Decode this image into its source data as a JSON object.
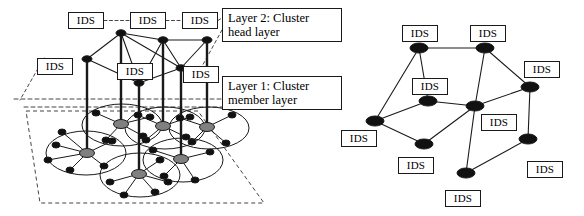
{
  "figure": {
    "ids_label": "IDS",
    "colors": {
      "stroke": "#1a1a1a",
      "node_fill": "#111111",
      "cluster_head_fill": "#808080",
      "background": "#ffffff",
      "dashed": "#444444"
    }
  },
  "left_diagram": {
    "name": "two-layer-cluster-architecture",
    "layer_labels": [
      {
        "id": "layer2",
        "text": "Layer 2: Cluster\nhead layer",
        "x": 222,
        "y": 8,
        "w": 120,
        "h": 34
      },
      {
        "id": "layer1",
        "text": "Layer 1: Cluster\nmember layer",
        "x": 222,
        "y": 76,
        "w": 120,
        "h": 34
      }
    ],
    "ids_boxes": [
      {
        "id": "left-ids-top-1",
        "x": 68,
        "y": 12,
        "w": 36,
        "h": 17
      },
      {
        "id": "left-ids-top-2",
        "x": 130,
        "y": 12,
        "w": 36,
        "h": 17
      },
      {
        "id": "left-ids-top-3",
        "x": 182,
        "y": 12,
        "w": 36,
        "h": 17
      },
      {
        "id": "left-ids-west",
        "x": 37,
        "y": 58,
        "w": 36,
        "h": 17
      },
      {
        "id": "left-ids-mid",
        "x": 117,
        "y": 63,
        "w": 36,
        "h": 17
      },
      {
        "id": "left-ids-east",
        "x": 183,
        "y": 66,
        "w": 36,
        "h": 17
      }
    ],
    "cluster_head_nodes": [
      {
        "id": "ch-a",
        "x": 121,
        "y": 33
      },
      {
        "id": "ch-b",
        "x": 163,
        "y": 40
      },
      {
        "id": "ch-c",
        "x": 207,
        "y": 40
      },
      {
        "id": "ch-d",
        "x": 87,
        "y": 59
      },
      {
        "id": "ch-e",
        "x": 181,
        "y": 68
      },
      {
        "id": "ch-f",
        "x": 139,
        "y": 83
      }
    ],
    "cluster_head_edges": [
      [
        "ch-a",
        "ch-b"
      ],
      [
        "ch-b",
        "ch-c"
      ],
      [
        "ch-a",
        "ch-d"
      ],
      [
        "ch-a",
        "ch-f"
      ],
      [
        "ch-d",
        "ch-f"
      ],
      [
        "ch-b",
        "ch-f"
      ],
      [
        "ch-b",
        "ch-e"
      ],
      [
        "ch-c",
        "ch-e"
      ],
      [
        "ch-e",
        "ch-f"
      ],
      [
        "ch-a",
        "ch-e"
      ]
    ],
    "dashed_top_ids_links": [
      [
        "left-ids-top-1",
        "left-ids-top-2"
      ],
      [
        "left-ids-top-2",
        "left-ids-top-3"
      ],
      [
        "left-ids-top-3",
        "layer2"
      ]
    ],
    "vertical_drop_lines": [
      {
        "from": "ch-a",
        "to": "cm-head-2"
      },
      {
        "from": "ch-b",
        "to": "cm-head-4"
      },
      {
        "from": "ch-c",
        "to": "cm-head-6"
      },
      {
        "from": "ch-d",
        "to": "cm-head-1"
      },
      {
        "from": "ch-e",
        "to": "cm-head-5"
      },
      {
        "from": "ch-f",
        "to": "cm-head-3"
      }
    ],
    "clusters": [
      {
        "id": "cluster-1",
        "cx": 86,
        "cy": 153,
        "rx": 40,
        "ry": 22,
        "head": {
          "id": "cm-head-1",
          "x": 87,
          "y": 153
        },
        "members": [
          {
            "x": 56,
            "y": 145
          },
          {
            "x": 48,
            "y": 160
          },
          {
            "x": 70,
            "y": 170
          },
          {
            "x": 104,
            "y": 166
          },
          {
            "x": 112,
            "y": 141
          },
          {
            "x": 62,
            "y": 132
          }
        ]
      },
      {
        "id": "cluster-2",
        "cx": 122,
        "cy": 125,
        "rx": 40,
        "ry": 21,
        "head": {
          "id": "cm-head-2",
          "x": 121,
          "y": 124
        },
        "members": [
          {
            "x": 96,
            "y": 113
          },
          {
            "x": 106,
            "y": 140
          },
          {
            "x": 143,
            "y": 136
          },
          {
            "x": 150,
            "y": 117
          }
        ]
      },
      {
        "id": "cluster-3",
        "cx": 140,
        "cy": 175,
        "rx": 40,
        "ry": 22,
        "head": {
          "id": "cm-head-3",
          "x": 139,
          "y": 174
        },
        "members": [
          {
            "x": 110,
            "y": 182
          },
          {
            "x": 124,
            "y": 195
          },
          {
            "x": 155,
            "y": 192
          },
          {
            "x": 168,
            "y": 182
          },
          {
            "x": 160,
            "y": 160
          }
        ]
      },
      {
        "id": "cluster-4",
        "cx": 165,
        "cy": 128,
        "rx": 40,
        "ry": 21,
        "head": {
          "id": "cm-head-4",
          "x": 163,
          "y": 126
        },
        "members": [
          {
            "x": 138,
            "y": 115
          },
          {
            "x": 146,
            "y": 140
          },
          {
            "x": 186,
            "y": 137
          },
          {
            "x": 190,
            "y": 117
          }
        ]
      },
      {
        "id": "cluster-5",
        "cx": 183,
        "cy": 160,
        "rx": 40,
        "ry": 22,
        "head": {
          "id": "cm-head-5",
          "x": 181,
          "y": 159
        },
        "members": [
          {
            "x": 153,
            "y": 150
          },
          {
            "x": 164,
            "y": 176
          },
          {
            "x": 195,
            "y": 180
          },
          {
            "x": 210,
            "y": 152
          }
        ]
      },
      {
        "id": "cluster-6",
        "cx": 209,
        "cy": 128,
        "rx": 40,
        "ry": 21,
        "head": {
          "id": "cm-head-6",
          "x": 207,
          "y": 127
        },
        "members": [
          {
            "x": 180,
            "y": 118
          },
          {
            "x": 192,
            "y": 142
          },
          {
            "x": 226,
            "y": 143
          },
          {
            "x": 232,
            "y": 115
          }
        ]
      }
    ],
    "ground_plane": [
      [
        26,
        111
      ],
      [
        198,
        111
      ],
      [
        264,
        203
      ],
      [
        40,
        203
      ]
    ],
    "layer_divider_lines": [
      {
        "y": 99,
        "x1": 14,
        "x2": 260
      },
      {
        "y": 107,
        "x1": 24,
        "x2": 268
      }
    ],
    "dashed_pointers": [
      {
        "from": [
          44,
          58
        ],
        "to": [
          20,
          100
        ]
      },
      {
        "from": [
          222,
          30
        ],
        "to": [
          200,
          70
        ]
      },
      {
        "from": [
          226,
          92
        ],
        "to": [
          250,
          110
        ]
      }
    ]
  },
  "right_diagram": {
    "name": "flat-peer-ids-network",
    "nodes": [
      {
        "id": "r1",
        "x": 419,
        "y": 48
      },
      {
        "id": "r2",
        "x": 485,
        "y": 48
      },
      {
        "id": "r3",
        "x": 428,
        "y": 101
      },
      {
        "id": "r4",
        "x": 475,
        "y": 106
      },
      {
        "id": "r5",
        "x": 530,
        "y": 87
      },
      {
        "id": "r6",
        "x": 375,
        "y": 121
      },
      {
        "id": "r7",
        "x": 424,
        "y": 144
      },
      {
        "id": "r8",
        "x": 528,
        "y": 139
      },
      {
        "id": "r9",
        "x": 466,
        "y": 173
      }
    ],
    "edges": [
      [
        "r1",
        "r2"
      ],
      [
        "r1",
        "r3"
      ],
      [
        "r1",
        "r6"
      ],
      [
        "r2",
        "r4"
      ],
      [
        "r2",
        "r5"
      ],
      [
        "r3",
        "r4"
      ],
      [
        "r3",
        "r6"
      ],
      [
        "r4",
        "r5"
      ],
      [
        "r4",
        "r7"
      ],
      [
        "r4",
        "r9"
      ],
      [
        "r5",
        "r8"
      ],
      [
        "r6",
        "r7"
      ],
      [
        "r8",
        "r9"
      ]
    ],
    "ids_boxes": [
      {
        "id": "right-ids-1",
        "x": 402,
        "y": 25,
        "w": 36,
        "h": 17
      },
      {
        "id": "right-ids-2",
        "x": 470,
        "y": 25,
        "w": 36,
        "h": 17
      },
      {
        "id": "right-ids-3",
        "x": 412,
        "y": 78,
        "w": 36,
        "h": 17
      },
      {
        "id": "right-ids-4",
        "x": 524,
        "y": 61,
        "w": 36,
        "h": 17
      },
      {
        "id": "right-ids-5",
        "x": 481,
        "y": 114,
        "w": 36,
        "h": 17
      },
      {
        "id": "right-ids-6",
        "x": 341,
        "y": 130,
        "w": 36,
        "h": 17
      },
      {
        "id": "right-ids-7",
        "x": 398,
        "y": 157,
        "w": 36,
        "h": 17
      },
      {
        "id": "right-ids-8",
        "x": 527,
        "y": 161,
        "w": 36,
        "h": 17
      },
      {
        "id": "right-ids-9",
        "x": 445,
        "y": 190,
        "w": 36,
        "h": 17
      }
    ]
  }
}
